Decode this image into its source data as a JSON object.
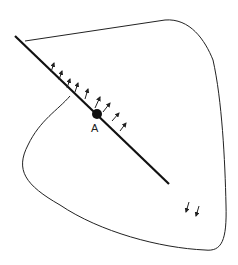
{
  "diagram": {
    "point_label": "A",
    "colors": {
      "stroke": "#222222",
      "background": "#ffffff"
    },
    "line": {
      "x1": 15,
      "y1": 36,
      "x2": 169,
      "y2": 184
    },
    "point": {
      "cx": 97,
      "cy": 114,
      "r": 5
    },
    "arrows_near_line": [
      {
        "x": 51,
        "y": 72,
        "dx": 3,
        "dy": -9
      },
      {
        "x": 59,
        "y": 80,
        "dx": 3,
        "dy": -9
      },
      {
        "x": 67,
        "y": 88,
        "dx": 3,
        "dy": -9
      },
      {
        "x": 75,
        "y": 92,
        "dx": 3,
        "dy": -9
      },
      {
        "x": 85,
        "y": 99,
        "dx": 3,
        "dy": -10
      },
      {
        "x": 95,
        "y": 108,
        "dx": 5,
        "dy": -11
      },
      {
        "x": 103,
        "y": 112,
        "dx": 7,
        "dy": -9
      },
      {
        "x": 112,
        "y": 121,
        "dx": 7,
        "dy": -8
      },
      {
        "x": 120,
        "y": 131,
        "dx": 6,
        "dy": -8
      }
    ],
    "arrows_bottom_right": [
      {
        "x": 189,
        "y": 202,
        "dx": -3,
        "dy": 10
      },
      {
        "x": 199,
        "y": 206,
        "dx": -3,
        "dy": 10
      }
    ]
  }
}
